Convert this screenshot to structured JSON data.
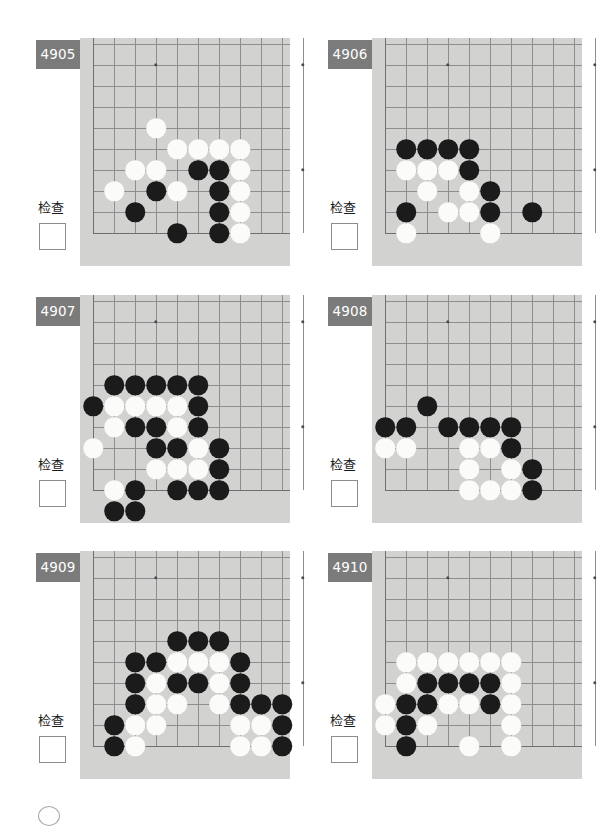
{
  "page": {
    "width": 607,
    "height": 818,
    "background": "#ffffff",
    "board_color": "#d2d2d0",
    "grid_color": "#8e8e90",
    "badge_color": "#7b7b7b",
    "badge_text_color": "#ffffff",
    "black_stone_color": "#1b1b1b",
    "white_stone_color": "#fbfbf9"
  },
  "common": {
    "check_label": "检查",
    "checkbox_value": ""
  },
  "board_geometry": {
    "cols": 11,
    "rows": 10,
    "cell": 21,
    "stone_diameter": 19.5,
    "note": "Each diagram shows a bottom-left corner region of a go board; column 1 is the left board edge, row 10 is the bottom board edge."
  },
  "problems": [
    {
      "id": "4905",
      "number": "4905",
      "check_label": "检查",
      "stars": [
        [
          4,
          2
        ],
        [
          11,
          2
        ],
        [
          11,
          7
        ]
      ],
      "edges": {
        "left": true,
        "bottom": true,
        "right": false,
        "top": false
      },
      "stones": [
        {
          "color": "white",
          "col": 4,
          "row": 5
        },
        {
          "color": "white",
          "col": 5,
          "row": 6
        },
        {
          "color": "white",
          "col": 6,
          "row": 6
        },
        {
          "color": "white",
          "col": 7,
          "row": 6
        },
        {
          "color": "white",
          "col": 8,
          "row": 6
        },
        {
          "color": "white",
          "col": 3,
          "row": 7
        },
        {
          "color": "white",
          "col": 4,
          "row": 7
        },
        {
          "color": "black",
          "col": 6,
          "row": 7
        },
        {
          "color": "black",
          "col": 7,
          "row": 7
        },
        {
          "color": "white",
          "col": 8,
          "row": 7
        },
        {
          "color": "white",
          "col": 2,
          "row": 8
        },
        {
          "color": "black",
          "col": 4,
          "row": 8
        },
        {
          "color": "white",
          "col": 5,
          "row": 8
        },
        {
          "color": "black",
          "col": 7,
          "row": 8
        },
        {
          "color": "white",
          "col": 8,
          "row": 8
        },
        {
          "color": "black",
          "col": 3,
          "row": 9
        },
        {
          "color": "black",
          "col": 7,
          "row": 9
        },
        {
          "color": "white",
          "col": 8,
          "row": 9
        },
        {
          "color": "black",
          "col": 5,
          "row": 10
        },
        {
          "color": "black",
          "col": 7,
          "row": 10
        },
        {
          "color": "white",
          "col": 8,
          "row": 10
        }
      ]
    },
    {
      "id": "4906",
      "number": "4906",
      "check_label": "检查",
      "stars": [
        [
          4,
          2
        ],
        [
          11,
          2
        ],
        [
          11,
          7
        ]
      ],
      "edges": {
        "left": true,
        "bottom": true,
        "right": false,
        "top": false
      },
      "stones": [
        {
          "color": "black",
          "col": 2,
          "row": 6
        },
        {
          "color": "black",
          "col": 3,
          "row": 6
        },
        {
          "color": "black",
          "col": 4,
          "row": 6
        },
        {
          "color": "black",
          "col": 5,
          "row": 6
        },
        {
          "color": "white",
          "col": 2,
          "row": 7
        },
        {
          "color": "white",
          "col": 3,
          "row": 7
        },
        {
          "color": "white",
          "col": 4,
          "row": 7
        },
        {
          "color": "black",
          "col": 5,
          "row": 7
        },
        {
          "color": "white",
          "col": 3,
          "row": 8
        },
        {
          "color": "white",
          "col": 5,
          "row": 8
        },
        {
          "color": "black",
          "col": 6,
          "row": 8
        },
        {
          "color": "black",
          "col": 2,
          "row": 9
        },
        {
          "color": "white",
          "col": 4,
          "row": 9
        },
        {
          "color": "white",
          "col": 5,
          "row": 9
        },
        {
          "color": "black",
          "col": 6,
          "row": 9
        },
        {
          "color": "black",
          "col": 8,
          "row": 9
        },
        {
          "color": "white",
          "col": 2,
          "row": 10
        },
        {
          "color": "white",
          "col": 6,
          "row": 10
        }
      ]
    },
    {
      "id": "4907",
      "number": "4907",
      "check_label": "检查",
      "stars": [
        [
          4,
          2
        ],
        [
          11,
          2
        ],
        [
          11,
          7
        ]
      ],
      "edges": {
        "left": true,
        "bottom": true,
        "right": false,
        "top": false
      },
      "stones": [
        {
          "color": "black",
          "col": 2,
          "row": 5
        },
        {
          "color": "black",
          "col": 3,
          "row": 5
        },
        {
          "color": "black",
          "col": 4,
          "row": 5
        },
        {
          "color": "black",
          "col": 5,
          "row": 5
        },
        {
          "color": "black",
          "col": 6,
          "row": 5
        },
        {
          "color": "black",
          "col": 1,
          "row": 6
        },
        {
          "color": "white",
          "col": 2,
          "row": 6
        },
        {
          "color": "white",
          "col": 3,
          "row": 6
        },
        {
          "color": "white",
          "col": 4,
          "row": 6
        },
        {
          "color": "white",
          "col": 5,
          "row": 6
        },
        {
          "color": "black",
          "col": 6,
          "row": 6
        },
        {
          "color": "white",
          "col": 2,
          "row": 7
        },
        {
          "color": "black",
          "col": 3,
          "row": 7
        },
        {
          "color": "black",
          "col": 4,
          "row": 7
        },
        {
          "color": "white",
          "col": 5,
          "row": 7
        },
        {
          "color": "black",
          "col": 6,
          "row": 7
        },
        {
          "color": "white",
          "col": 1,
          "row": 8
        },
        {
          "color": "black",
          "col": 4,
          "row": 8
        },
        {
          "color": "black",
          "col": 5,
          "row": 8
        },
        {
          "color": "white",
          "col": 6,
          "row": 8
        },
        {
          "color": "black",
          "col": 7,
          "row": 8
        },
        {
          "color": "white",
          "col": 4,
          "row": 9
        },
        {
          "color": "white",
          "col": 5,
          "row": 9
        },
        {
          "color": "white",
          "col": 6,
          "row": 9
        },
        {
          "color": "black",
          "col": 7,
          "row": 9
        },
        {
          "color": "white",
          "col": 2,
          "row": 10
        },
        {
          "color": "black",
          "col": 3,
          "row": 10
        },
        {
          "color": "black",
          "col": 5,
          "row": 10
        },
        {
          "color": "black",
          "col": 6,
          "row": 10
        },
        {
          "color": "black",
          "col": 7,
          "row": 10
        },
        {
          "color": "black",
          "col": 2,
          "row": 11
        },
        {
          "color": "black",
          "col": 3,
          "row": 11
        }
      ]
    },
    {
      "id": "4908",
      "number": "4908",
      "check_label": "检查",
      "stars": [
        [
          4,
          2
        ],
        [
          11,
          2
        ],
        [
          11,
          7
        ]
      ],
      "edges": {
        "left": true,
        "bottom": true,
        "right": false,
        "top": false
      },
      "stones": [
        {
          "color": "black",
          "col": 3,
          "row": 6
        },
        {
          "color": "black",
          "col": 1,
          "row": 7
        },
        {
          "color": "black",
          "col": 2,
          "row": 7
        },
        {
          "color": "black",
          "col": 4,
          "row": 7
        },
        {
          "color": "black",
          "col": 5,
          "row": 7
        },
        {
          "color": "black",
          "col": 6,
          "row": 7
        },
        {
          "color": "black",
          "col": 7,
          "row": 7
        },
        {
          "color": "white",
          "col": 1,
          "row": 8
        },
        {
          "color": "white",
          "col": 2,
          "row": 8
        },
        {
          "color": "white",
          "col": 5,
          "row": 8
        },
        {
          "color": "white",
          "col": 6,
          "row": 8
        },
        {
          "color": "black",
          "col": 7,
          "row": 8
        },
        {
          "color": "white",
          "col": 5,
          "row": 9
        },
        {
          "color": "white",
          "col": 7,
          "row": 9
        },
        {
          "color": "black",
          "col": 8,
          "row": 9
        },
        {
          "color": "white",
          "col": 5,
          "row": 10
        },
        {
          "color": "white",
          "col": 6,
          "row": 10
        },
        {
          "color": "white",
          "col": 7,
          "row": 10
        },
        {
          "color": "black",
          "col": 8,
          "row": 10
        }
      ]
    },
    {
      "id": "4909",
      "number": "4909",
      "check_label": "检查",
      "stars": [
        [
          4,
          2
        ],
        [
          11,
          2
        ],
        [
          11,
          7
        ]
      ],
      "edges": {
        "left": true,
        "bottom": true,
        "right": false,
        "top": false
      },
      "stones": [
        {
          "color": "black",
          "col": 5,
          "row": 5
        },
        {
          "color": "black",
          "col": 6,
          "row": 5
        },
        {
          "color": "black",
          "col": 7,
          "row": 5
        },
        {
          "color": "black",
          "col": 3,
          "row": 6
        },
        {
          "color": "black",
          "col": 4,
          "row": 6
        },
        {
          "color": "white",
          "col": 5,
          "row": 6
        },
        {
          "color": "white",
          "col": 6,
          "row": 6
        },
        {
          "color": "white",
          "col": 7,
          "row": 6
        },
        {
          "color": "black",
          "col": 8,
          "row": 6
        },
        {
          "color": "black",
          "col": 3,
          "row": 7
        },
        {
          "color": "white",
          "col": 4,
          "row": 7
        },
        {
          "color": "black",
          "col": 5,
          "row": 7
        },
        {
          "color": "black",
          "col": 6,
          "row": 7
        },
        {
          "color": "white",
          "col": 7,
          "row": 7
        },
        {
          "color": "black",
          "col": 8,
          "row": 7
        },
        {
          "color": "black",
          "col": 3,
          "row": 8
        },
        {
          "color": "white",
          "col": 4,
          "row": 8
        },
        {
          "color": "white",
          "col": 5,
          "row": 8
        },
        {
          "color": "white",
          "col": 7,
          "row": 8
        },
        {
          "color": "black",
          "col": 8,
          "row": 8
        },
        {
          "color": "black",
          "col": 9,
          "row": 8
        },
        {
          "color": "black",
          "col": 10,
          "row": 8
        },
        {
          "color": "black",
          "col": 2,
          "row": 9
        },
        {
          "color": "white",
          "col": 3,
          "row": 9
        },
        {
          "color": "white",
          "col": 4,
          "row": 9
        },
        {
          "color": "white",
          "col": 8,
          "row": 9
        },
        {
          "color": "white",
          "col": 9,
          "row": 9
        },
        {
          "color": "black",
          "col": 10,
          "row": 9
        },
        {
          "color": "black",
          "col": 2,
          "row": 10
        },
        {
          "color": "white",
          "col": 3,
          "row": 10
        },
        {
          "color": "white",
          "col": 8,
          "row": 10
        },
        {
          "color": "white",
          "col": 9,
          "row": 10
        },
        {
          "color": "black",
          "col": 10,
          "row": 10
        }
      ]
    },
    {
      "id": "4910",
      "number": "4910",
      "check_label": "检查",
      "stars": [
        [
          4,
          2
        ],
        [
          11,
          2
        ],
        [
          11,
          7
        ]
      ],
      "edges": {
        "left": true,
        "bottom": true,
        "right": false,
        "top": false
      },
      "stones": [
        {
          "color": "white",
          "col": 2,
          "row": 6
        },
        {
          "color": "white",
          "col": 3,
          "row": 6
        },
        {
          "color": "white",
          "col": 4,
          "row": 6
        },
        {
          "color": "white",
          "col": 5,
          "row": 6
        },
        {
          "color": "white",
          "col": 6,
          "row": 6
        },
        {
          "color": "white",
          "col": 7,
          "row": 6
        },
        {
          "color": "white",
          "col": 2,
          "row": 7
        },
        {
          "color": "black",
          "col": 3,
          "row": 7
        },
        {
          "color": "black",
          "col": 4,
          "row": 7
        },
        {
          "color": "black",
          "col": 5,
          "row": 7
        },
        {
          "color": "black",
          "col": 6,
          "row": 7
        },
        {
          "color": "white",
          "col": 7,
          "row": 7
        },
        {
          "color": "white",
          "col": 1,
          "row": 8
        },
        {
          "color": "black",
          "col": 2,
          "row": 8
        },
        {
          "color": "black",
          "col": 3,
          "row": 8
        },
        {
          "color": "white",
          "col": 4,
          "row": 8
        },
        {
          "color": "white",
          "col": 5,
          "row": 8
        },
        {
          "color": "black",
          "col": 6,
          "row": 8
        },
        {
          "color": "white",
          "col": 7,
          "row": 8
        },
        {
          "color": "white",
          "col": 1,
          "row": 9
        },
        {
          "color": "black",
          "col": 2,
          "row": 9
        },
        {
          "color": "white",
          "col": 3,
          "row": 9
        },
        {
          "color": "white",
          "col": 7,
          "row": 9
        },
        {
          "color": "black",
          "col": 2,
          "row": 10
        },
        {
          "color": "white",
          "col": 5,
          "row": 10
        },
        {
          "color": "white",
          "col": 7,
          "row": 10
        }
      ]
    }
  ]
}
